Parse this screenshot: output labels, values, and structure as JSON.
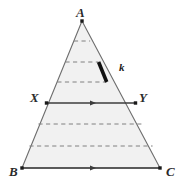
{
  "figure": {
    "type": "geometry-diagram",
    "shape": "triangle",
    "colors": {
      "background": "#ffffff",
      "fill": "#f1f1f1",
      "outline": "#6e6e6e",
      "dashed_line": "#808080",
      "solid_line": "#3c3c3c",
      "highlight_segment": "#111111",
      "label": "#2b2b2b"
    },
    "vertices": [
      {
        "name": "A",
        "label": "A",
        "x": 82,
        "y": 21,
        "marker": "square-dot"
      },
      {
        "name": "B",
        "label": "B",
        "x": 22,
        "y": 168,
        "marker": "square-dot"
      },
      {
        "name": "C",
        "label": "C",
        "x": 160,
        "y": 168,
        "marker": "square-dot"
      }
    ],
    "points": [
      {
        "name": "X",
        "label": "X",
        "x": 46.5,
        "y": 103,
        "marker": "square-dot",
        "on_edge": "AB"
      },
      {
        "name": "Y",
        "label": "Y",
        "x": 135.5,
        "y": 103,
        "marker": "square-dot",
        "on_edge": "AC"
      }
    ],
    "dashed_lines": [
      {
        "index": 1,
        "y": 41,
        "x1": 73.9,
        "x2": 90.1
      },
      {
        "index": 2,
        "y": 62,
        "x1": 65.4,
        "x2": 98.6
      },
      {
        "index": 3,
        "y": 82,
        "x1": 57.3,
        "x2": 106.7
      },
      {
        "index": 4,
        "y": 124,
        "x1": 38.4,
        "x2": 143.6
      },
      {
        "index": 5,
        "y": 146,
        "x1": 29.4,
        "x2": 152.6
      }
    ],
    "solid_lines": [
      {
        "name": "XY",
        "from": "X",
        "to": "Y",
        "y": 103,
        "x1": 46.5,
        "x2": 135.5,
        "arrow": "single",
        "arrow_x": 91
      },
      {
        "name": "BC",
        "from": "B",
        "to": "C",
        "y": 168,
        "x1": 22,
        "x2": 160,
        "arrow": "single",
        "arrow_x": 91
      }
    ],
    "highlight": {
      "label": "k",
      "on_edge": "AC",
      "x1": 98.6,
      "y1": 62,
      "x2": 106.7,
      "y2": 82,
      "stroke_width": 3.6
    }
  }
}
